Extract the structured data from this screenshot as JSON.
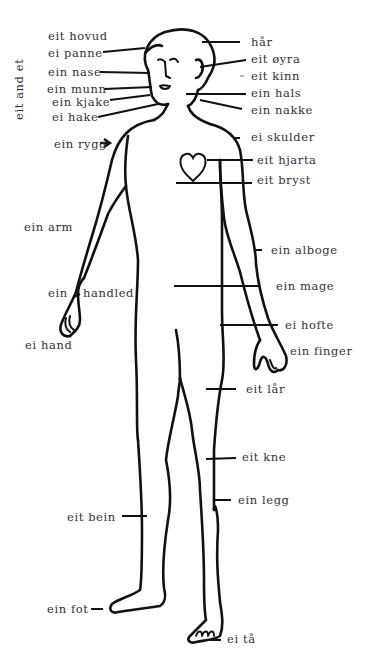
{
  "diagram": {
    "title_vertical": "eit and et",
    "labels_left": [
      {
        "id": "hovud",
        "text": "eit hovud"
      },
      {
        "id": "panne",
        "text": "ei panne"
      },
      {
        "id": "nase",
        "text": "ein nase"
      },
      {
        "id": "munn",
        "text": "ein munn"
      },
      {
        "id": "kjake",
        "text": "ein kjake"
      },
      {
        "id": "hake",
        "text": "ei hake"
      },
      {
        "id": "rygg",
        "text": "ein rygg"
      },
      {
        "id": "arm",
        "text": "ein arm"
      },
      {
        "id": "handled_ein",
        "text": "ein"
      },
      {
        "id": "handled",
        "text": "handled"
      },
      {
        "id": "hand",
        "text": "ei hand"
      },
      {
        "id": "bein",
        "text": "eit bein"
      },
      {
        "id": "fot",
        "text": "ein fot"
      }
    ],
    "labels_right": [
      {
        "id": "har",
        "text": "hår"
      },
      {
        "id": "oyra",
        "text": "eit øyra"
      },
      {
        "id": "kinn",
        "text": "eit kinn"
      },
      {
        "id": "hals",
        "text": "ein hals"
      },
      {
        "id": "nakke",
        "text": "ein nakke"
      },
      {
        "id": "skulder",
        "text": "ei skulder"
      },
      {
        "id": "hjarta",
        "text": "eit hjarta"
      },
      {
        "id": "bryst",
        "text": "eit bryst"
      },
      {
        "id": "alboge",
        "text": "ein alboge"
      },
      {
        "id": "mage",
        "text": "ein mage"
      },
      {
        "id": "hofte",
        "text": "ei hofte"
      },
      {
        "id": "finger",
        "text": "ein finger"
      },
      {
        "id": "lar",
        "text": "eit lår"
      },
      {
        "id": "kne",
        "text": "eit kne"
      },
      {
        "id": "legg",
        "text": "ein legg"
      },
      {
        "id": "ta",
        "text": "ei tå"
      }
    ],
    "colors": {
      "line": "#111111",
      "text": "#333333",
      "background": "#ffffff"
    }
  }
}
